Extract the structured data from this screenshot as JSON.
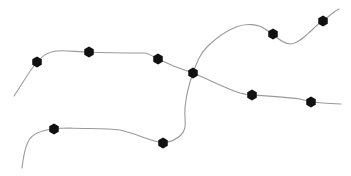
{
  "diagram": {
    "type": "network-graph",
    "background": "#ffffff",
    "edge_color": "#9a9a9a",
    "node_color": "#111111",
    "node_shape": "hexagon",
    "node_radius": 5.5,
    "edges": [
      {
        "id": "edge-west",
        "d": "M14,96 C22,84 30,70 37,62 C44,55 46,53 56,51 C66,50 78,52 89,52 C105,53 125,53 145,53 C150,54 154,57 158,59 C168,64 180,69 193,73"
      },
      {
        "id": "edge-northeast",
        "d": "M193,73 C197,62 200,54 207,47 C215,39 226,31 236,27 C246,23 258,24 265,29 C268,31 270,32 273,34 C279,40 284,44 291,44 C299,43 305,36 312,30 C316,26 319,23 323,21 C328,17 333,12 339,9"
      },
      {
        "id": "edge-south",
        "d": "M193,73 C189,84 186,96 185,108 C184,120 188,128 181,135 C176,140 170,142 163,143 C150,141 135,133 120,130 C105,128 85,129 70,128 C62,128 58,128 54,129 C42,130 32,133 28,142 C24,150 23,160 22,168"
      },
      {
        "id": "edge-east",
        "d": "M193,73 C210,80 225,88 240,93 C244,94 248,95 252,95 C268,96 285,97 300,99 C304,100 308,101 311,102 C322,103 332,104 341,104"
      }
    ],
    "nodes": [
      {
        "id": "node-a",
        "x": 37,
        "y": 62
      },
      {
        "id": "node-b",
        "x": 89,
        "y": 52
      },
      {
        "id": "node-c",
        "x": 158,
        "y": 59
      },
      {
        "id": "node-hub",
        "x": 193,
        "y": 73
      },
      {
        "id": "node-d",
        "x": 273,
        "y": 34
      },
      {
        "id": "node-e",
        "x": 323,
        "y": 21
      },
      {
        "id": "node-f",
        "x": 252,
        "y": 95
      },
      {
        "id": "node-g",
        "x": 311,
        "y": 102
      },
      {
        "id": "node-h",
        "x": 54,
        "y": 129
      },
      {
        "id": "node-i",
        "x": 163,
        "y": 143
      }
    ]
  }
}
